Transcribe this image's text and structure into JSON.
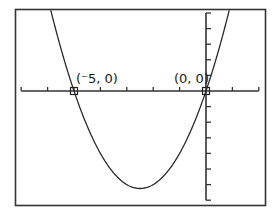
{
  "chart_data": {
    "type": "line",
    "title": "",
    "function": "y = x^2 + 5x",
    "xlabel": "",
    "ylabel": "",
    "xlim": [
      -7.2,
      2.2
    ],
    "ylim": [
      -7.5,
      5.2
    ],
    "x_tick_step": 1,
    "y_tick_step": 1,
    "grid": false,
    "series": [
      {
        "name": "parabola",
        "x": [
          -7,
          -6.5,
          -6,
          -5.5,
          -5,
          -4.5,
          -4,
          -3.5,
          -3,
          -2.5,
          -2,
          -1.5,
          -1,
          -0.5,
          0,
          0.5,
          1
        ],
        "y": [
          14,
          9.75,
          6,
          2.75,
          0,
          -2.25,
          -4,
          -5.25,
          -6,
          -6.25,
          -6,
          -5.25,
          -4,
          -2.25,
          0,
          2.75,
          6
        ]
      }
    ],
    "points": [
      {
        "x": -5,
        "y": 0,
        "label": "(⁻5, 0)"
      },
      {
        "x": 0,
        "y": 0,
        "label": "(0, 0)"
      }
    ],
    "vertex": {
      "x": -2.5,
      "y": -6.25
    }
  },
  "labels": {
    "point1": "(⁻5, 0)",
    "point2": "(0, 0)"
  },
  "colors": {
    "line": "#2a2a2a",
    "frame": "#333333",
    "background": "#ffffff"
  }
}
